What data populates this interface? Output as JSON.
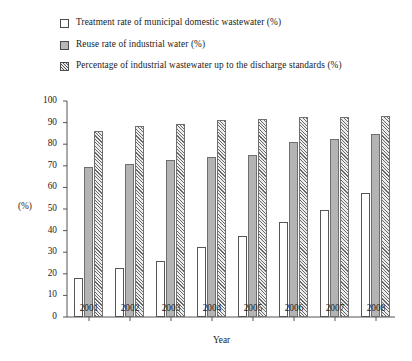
{
  "legend": {
    "items": [
      {
        "label": "Treatment rate of municipal domestic wastewater (%)",
        "swatch": "white-outline-swatch"
      },
      {
        "label": "Reuse rate of industrial water (%)",
        "swatch": "gray-filled-swatch"
      },
      {
        "label": "Percentage of industrial wastewater up to the discharge standards (%)",
        "swatch": "hatched-swatch"
      }
    ]
  },
  "chart_data": {
    "type": "bar",
    "title": "",
    "xlabel": "Year",
    "ylabel": "(%)",
    "categories": [
      "2001",
      "2002",
      "2003",
      "2004",
      "2005",
      "2006",
      "2007",
      "2008"
    ],
    "yticks": [
      0,
      10,
      20,
      30,
      40,
      50,
      60,
      70,
      80,
      90,
      100
    ],
    "ylim": [
      0,
      100
    ],
    "grid": false,
    "legend_position": "top-left",
    "series": [
      {
        "name": "Treatment rate of municipal domestic wastewater (%)",
        "values": [
          18,
          22.5,
          26,
          32.5,
          37.5,
          44,
          49.5,
          57.5
        ]
      },
      {
        "name": "Reuse rate of industrial water (%)",
        "values": [
          69.5,
          71,
          72.5,
          74,
          75,
          81,
          82.5,
          84.5
        ]
      },
      {
        "name": "Percentage of industrial wastewater up to the discharge standards (%)",
        "values": [
          86,
          88.5,
          89.5,
          91,
          91.5,
          92.5,
          92.5,
          93
        ]
      }
    ]
  }
}
